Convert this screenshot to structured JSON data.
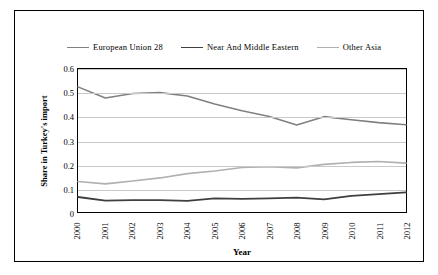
{
  "chart_data": {
    "type": "line",
    "title": "",
    "xlabel": "Year",
    "ylabel": "Share in Turkey's import",
    "categories": [
      "2000",
      "2001",
      "2002",
      "2003",
      "2004",
      "2005",
      "2006",
      "2007",
      "2008",
      "2009",
      "2010",
      "2011",
      "2012"
    ],
    "ylim": [
      0,
      0.6
    ],
    "yticks": [
      "0",
      "0.1",
      "0.2",
      "0.3",
      "0.4",
      "0.5",
      "0.6"
    ],
    "grid": true,
    "legend_position": "top",
    "series": [
      {
        "name": "European Union 28",
        "color": "#808080",
        "width": 1.6,
        "values": [
          0.525,
          0.478,
          0.497,
          0.501,
          0.487,
          0.453,
          0.425,
          0.401,
          0.365,
          0.4,
          0.387,
          0.375,
          0.366
        ]
      },
      {
        "name": "Near And Middle Eastern",
        "color": "#3f3f3f",
        "width": 1.8,
        "values": [
          0.063,
          0.048,
          0.05,
          0.05,
          0.047,
          0.057,
          0.055,
          0.057,
          0.06,
          0.053,
          0.068,
          0.075,
          0.082
        ]
      },
      {
        "name": "Other Asia",
        "color": "#b0b0b0",
        "width": 1.6,
        "values": [
          0.128,
          0.118,
          0.13,
          0.143,
          0.161,
          0.172,
          0.187,
          0.19,
          0.185,
          0.2,
          0.208,
          0.212,
          0.205
        ]
      }
    ]
  }
}
